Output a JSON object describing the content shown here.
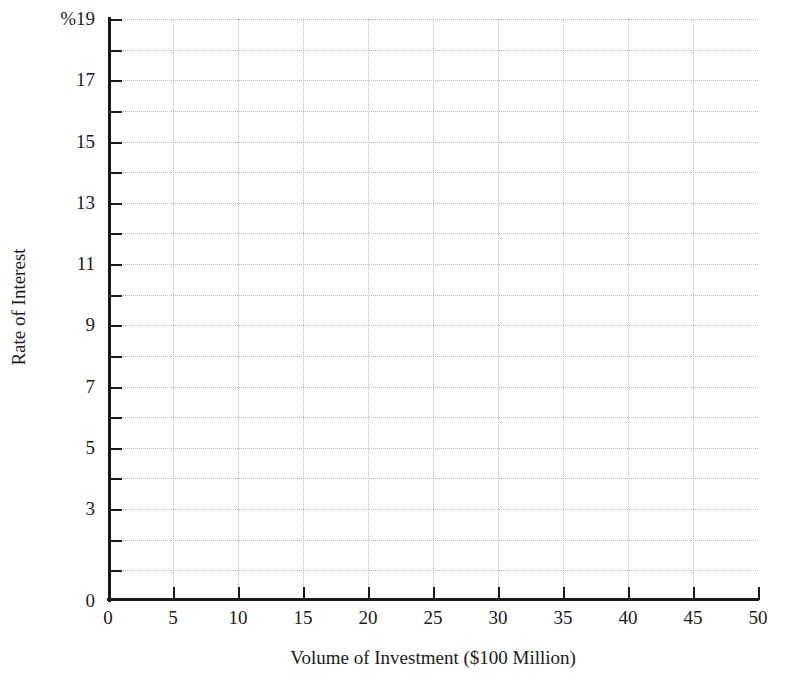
{
  "chart_data": {
    "type": "line",
    "title": "",
    "subtitle": "",
    "xlabel": "Volume of Investment ($100 Million)",
    "ylabel": "Rate of Interest",
    "xlim": [
      0,
      50
    ],
    "ylim": [
      0,
      19
    ],
    "grid": true,
    "legend": null,
    "series": [],
    "annotations": [],
    "note": "Empty plotting grid; no data series are drawn.",
    "x_ticks": [
      0,
      5,
      10,
      15,
      20,
      25,
      30,
      35,
      40,
      45,
      50
    ],
    "x_tick_labels": [
      "0",
      "5",
      "10",
      "15",
      "20",
      "25",
      "30",
      "35",
      "40",
      "45",
      "50"
    ],
    "x_minor_step": 5,
    "y_ticks": [
      0,
      1,
      2,
      3,
      4,
      5,
      6,
      7,
      8,
      9,
      10,
      11,
      12,
      13,
      14,
      15,
      16,
      17,
      18,
      19
    ],
    "y_labeled_ticks": [
      {
        "value": 19,
        "label": "%19"
      },
      {
        "value": 17,
        "label": "17"
      },
      {
        "value": 15,
        "label": "15"
      },
      {
        "value": 13,
        "label": "13"
      },
      {
        "value": 11,
        "label": "11"
      },
      {
        "value": 9,
        "label": "9"
      },
      {
        "value": 7,
        "label": "7"
      },
      {
        "value": 5,
        "label": "5"
      },
      {
        "value": 3,
        "label": "3"
      },
      {
        "value": 0,
        "label": "0"
      }
    ],
    "y_gridline_values": [
      1,
      2,
      3,
      4,
      5,
      6,
      7,
      8,
      9,
      10,
      11,
      12,
      13,
      14,
      15,
      16,
      17,
      18,
      19
    ],
    "x_gridline_values": [
      5,
      10,
      15,
      20,
      25,
      30,
      35,
      40,
      45,
      50
    ],
    "colors": {
      "background": "#ffffff",
      "axis": "#1a1a1a",
      "gridline": "#b9b9b9",
      "text": "#1a1a1a"
    }
  }
}
